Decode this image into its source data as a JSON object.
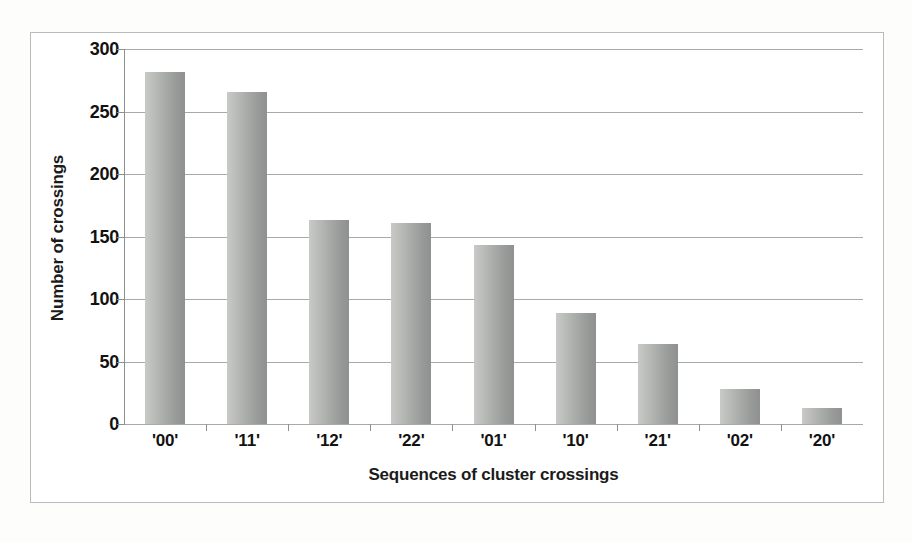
{
  "chart_data": {
    "type": "bar",
    "title": "",
    "subtitle": "",
    "xlabel": "Sequences of cluster crossings",
    "ylabel": "Number of crossings",
    "categories": [
      "'00'",
      "'11'",
      "'12'",
      "'22'",
      "'01'",
      "'10'",
      "'21'",
      "'02'",
      "'20'"
    ],
    "values": [
      282,
      266,
      163,
      161,
      143,
      89,
      64,
      28,
      13
    ],
    "ylim": [
      0,
      300
    ],
    "yticks": [
      0,
      50,
      100,
      150,
      200,
      250,
      300
    ],
    "ytick_labels": [
      "0",
      "50",
      "100",
      "150",
      "200",
      "250",
      "300"
    ],
    "grid": true,
    "grid_axis": "y",
    "legend": false,
    "legend_position": "none",
    "bar_color": "#a8aaa8",
    "gridline_color": "#a8aaa9",
    "axis_color": "#8e9190",
    "text_color": "#121212",
    "frame_color": "#b9bcbb",
    "background": "#ffffff"
  }
}
